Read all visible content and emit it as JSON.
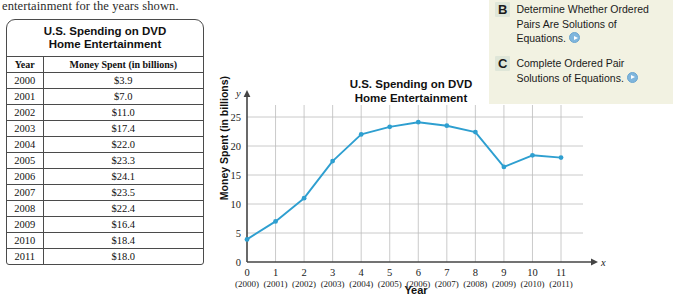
{
  "intro_text": "entertainment for the years shown.",
  "table": {
    "title_line1": "U.S. Spending on DVD",
    "title_line2": "Home Entertainment",
    "headers": [
      "Year",
      "Money Spent (in billions)"
    ],
    "rows": [
      [
        "2000",
        "$3.9"
      ],
      [
        "2001",
        "$7.0"
      ],
      [
        "2002",
        "$11.0"
      ],
      [
        "2003",
        "$17.4"
      ],
      [
        "2004",
        "$22.0"
      ],
      [
        "2005",
        "$23.3"
      ],
      [
        "2006",
        "$24.1"
      ],
      [
        "2007",
        "$23.5"
      ],
      [
        "2008",
        "$22.4"
      ],
      [
        "2009",
        "$16.4"
      ],
      [
        "2010",
        "$18.4"
      ],
      [
        "2011",
        "$18.0"
      ]
    ]
  },
  "chart_data": {
    "type": "line",
    "title": "U.S. Spending on DVD Home Entertainment",
    "title_line1": "U.S. Spending on DVD",
    "title_line2": "Home Entertainment",
    "xlabel": "Year",
    "ylabel": "Money Spent (in billions)",
    "x_axis_letter": "x",
    "y_axis_letter": "y",
    "x": [
      0,
      1,
      2,
      3,
      4,
      5,
      6,
      7,
      8,
      9,
      10,
      11
    ],
    "x_tick_labels": [
      "0",
      "1",
      "2",
      "3",
      "4",
      "5",
      "6",
      "7",
      "8",
      "9",
      "10",
      "11"
    ],
    "x_sub_labels": [
      "(2000)",
      "(2001)",
      "(2002)",
      "(2003)",
      "(2004)",
      "(2005)",
      "(2006)",
      "(2007)",
      "(2008)",
      "(2009)",
      "(2010)",
      "(2011)"
    ],
    "values": [
      3.9,
      7.0,
      11.0,
      17.4,
      22.0,
      23.3,
      24.1,
      23.5,
      22.4,
      16.4,
      18.4,
      18.0
    ],
    "y_tick_labels": [
      "0",
      "5",
      "10",
      "15",
      "20",
      "25"
    ],
    "y_ticks": [
      0,
      5,
      10,
      15,
      20,
      25
    ],
    "xlim": [
      0,
      11
    ],
    "ylim": [
      0,
      26
    ],
    "grid": true,
    "legend": "none",
    "series_color": "#2e9fd0",
    "marker_color": "#2e9fd0"
  },
  "objectives": {
    "items": [
      {
        "letter": "B",
        "line1": "Determine Whether Ordered",
        "line2": "Pairs Are Solutions of",
        "line3": "Equations."
      },
      {
        "letter": "C",
        "line1": "Complete Ordered Pair",
        "line2": "Solutions of Equations.",
        "line3": ""
      }
    ],
    "panel_color": "#f2f2e2",
    "badge_color": "#dfe6d8",
    "play_color": "#7fb6dd"
  }
}
